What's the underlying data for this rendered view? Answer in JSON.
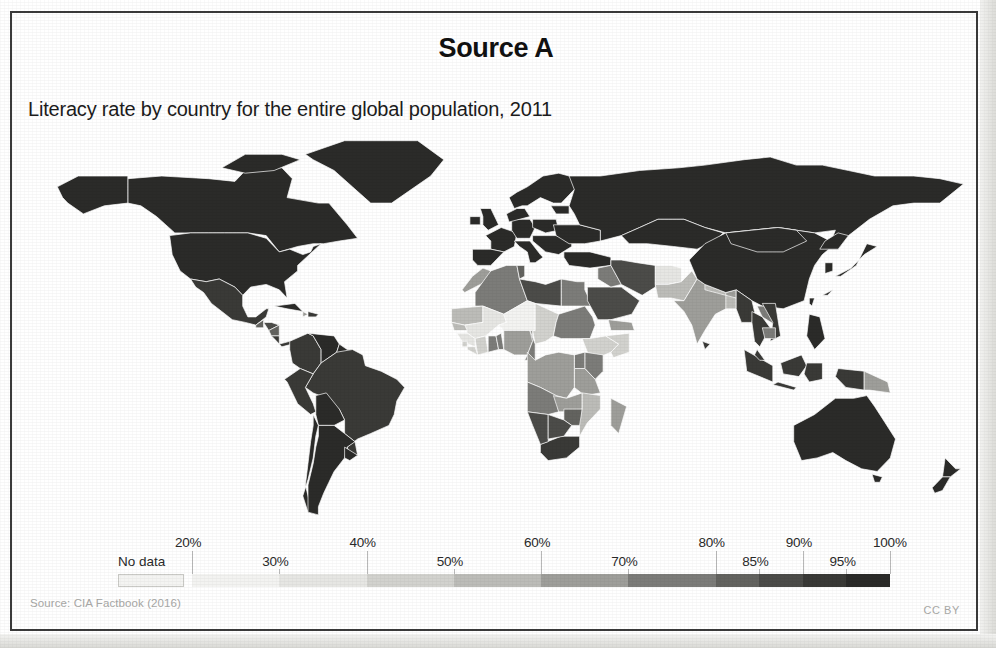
{
  "header": {
    "title": "Source A",
    "subtitle": "Literacy rate by country for the entire global population, 2011"
  },
  "footer": {
    "source": "Source: CIA Factbook (2016)",
    "license": "CC BY"
  },
  "legend": {
    "no_data_label": "No data",
    "no_data_color": "#f4f4f2",
    "ticks": [
      {
        "label": "20%",
        "pos": 0.0,
        "row": "top"
      },
      {
        "label": "30%",
        "pos": 0.125,
        "row": "bot"
      },
      {
        "label": "40%",
        "pos": 0.25,
        "row": "top"
      },
      {
        "label": "50%",
        "pos": 0.375,
        "row": "bot"
      },
      {
        "label": "60%",
        "pos": 0.5,
        "row": "top"
      },
      {
        "label": "70%",
        "pos": 0.625,
        "row": "bot"
      },
      {
        "label": "80%",
        "pos": 0.75,
        "row": "top"
      },
      {
        "label": "85%",
        "pos": 0.8125,
        "row": "bot"
      },
      {
        "label": "90%",
        "pos": 0.875,
        "row": "top"
      },
      {
        "label": "95%",
        "pos": 0.9375,
        "row": "bot"
      },
      {
        "label": "100%",
        "pos": 1.0,
        "row": "top"
      }
    ],
    "steps": [
      {
        "range": "20-30%",
        "color": "#f3f3f1",
        "width": 12.5
      },
      {
        "range": "30-40%",
        "color": "#e6e6e3",
        "width": 12.5
      },
      {
        "range": "40-50%",
        "color": "#d2d2ce",
        "width": 12.5
      },
      {
        "range": "50-60%",
        "color": "#bcbcb8",
        "width": 12.5
      },
      {
        "range": "60-70%",
        "color": "#9e9e9a",
        "width": 12.5
      },
      {
        "range": "70-80%",
        "color": "#7c7c79",
        "width": 12.5
      },
      {
        "range": "80-85%",
        "color": "#63635f",
        "width": 6.25
      },
      {
        "range": "85-90%",
        "color": "#4c4c49",
        "width": 6.25
      },
      {
        "range": "90-95%",
        "color": "#3a3a37",
        "width": 6.25
      },
      {
        "range": "95-100%",
        "color": "#2b2b29",
        "width": 6.25
      }
    ]
  },
  "chart_data": {
    "type": "heatmap",
    "title": "Literacy rate by country for the entire global population, 2011",
    "subtitle": "Source A",
    "xlabel": "",
    "ylabel": "",
    "value_unit": "percent literate",
    "value_range": [
      20,
      100
    ],
    "legend_position": "bottom",
    "grid": false,
    "map_projection": "equirectangular-world",
    "no_data_color": "#f4f4f2",
    "color_scale": [
      "#f3f3f1",
      "#e6e6e3",
      "#d2d2ce",
      "#bcbcb8",
      "#9e9e9a",
      "#7c7c79",
      "#63635f",
      "#4c4c49",
      "#3a3a37",
      "#2b2b29"
    ],
    "regions": [
      {
        "name": "Canada",
        "value": 99,
        "color": "#2b2b29"
      },
      {
        "name": "United States",
        "value": 99,
        "color": "#2b2b29"
      },
      {
        "name": "Greenland",
        "value": 100,
        "color": "#2b2b29"
      },
      {
        "name": "Mexico",
        "value": 94,
        "color": "#3a3a37"
      },
      {
        "name": "Guatemala",
        "value": 81,
        "color": "#63635f"
      },
      {
        "name": "Honduras",
        "value": 86,
        "color": "#4c4c49"
      },
      {
        "name": "Nicaragua",
        "value": 83,
        "color": "#63635f"
      },
      {
        "name": "Cuba",
        "value": 100,
        "color": "#2b2b29"
      },
      {
        "name": "Haiti",
        "value": 61,
        "color": "#9e9e9a"
      },
      {
        "name": "Dominican Republic",
        "value": 92,
        "color": "#3a3a37"
      },
      {
        "name": "Colombia",
        "value": 94,
        "color": "#3a3a37"
      },
      {
        "name": "Venezuela",
        "value": 96,
        "color": "#2b2b29"
      },
      {
        "name": "Brazil",
        "value": 92,
        "color": "#3a3a37"
      },
      {
        "name": "Peru",
        "value": 94,
        "color": "#3a3a37"
      },
      {
        "name": "Bolivia",
        "value": 95,
        "color": "#2b2b29"
      },
      {
        "name": "Chile",
        "value": 99,
        "color": "#2b2b29"
      },
      {
        "name": "Argentina",
        "value": 98,
        "color": "#2b2b29"
      },
      {
        "name": "Uruguay",
        "value": 98,
        "color": "#2b2b29"
      },
      {
        "name": "United Kingdom",
        "value": 99,
        "color": "#2b2b29"
      },
      {
        "name": "France",
        "value": 99,
        "color": "#2b2b29"
      },
      {
        "name": "Germany",
        "value": 99,
        "color": "#2b2b29"
      },
      {
        "name": "Spain",
        "value": 98,
        "color": "#2b2b29"
      },
      {
        "name": "Italy",
        "value": 99,
        "color": "#2b2b29"
      },
      {
        "name": "Poland",
        "value": 100,
        "color": "#2b2b29"
      },
      {
        "name": "Russia",
        "value": 100,
        "color": "#2b2b29"
      },
      {
        "name": "Ukraine",
        "value": 100,
        "color": "#2b2b29"
      },
      {
        "name": "Turkey",
        "value": 95,
        "color": "#2b2b29"
      },
      {
        "name": "Morocco",
        "value": 68,
        "color": "#9e9e9a"
      },
      {
        "name": "Algeria",
        "value": 80,
        "color": "#7c7c79"
      },
      {
        "name": "Tunisia",
        "value": 81,
        "color": "#63635f"
      },
      {
        "name": "Libya",
        "value": 90,
        "color": "#4c4c49"
      },
      {
        "name": "Egypt",
        "value": 74,
        "color": "#7c7c79"
      },
      {
        "name": "Mauritania",
        "value": 52,
        "color": "#bcbcb8"
      },
      {
        "name": "Mali",
        "value": 33,
        "color": "#e6e6e3"
      },
      {
        "name": "Niger",
        "value": 19,
        "color": "#f3f3f1"
      },
      {
        "name": "Chad",
        "value": 40,
        "color": "#d2d2ce"
      },
      {
        "name": "Sudan",
        "value": 72,
        "color": "#7c7c79"
      },
      {
        "name": "Senegal",
        "value": 50,
        "color": "#bcbcb8"
      },
      {
        "name": "Guinea",
        "value": 30,
        "color": "#e6e6e3"
      },
      {
        "name": "Sierra Leone",
        "value": 43,
        "color": "#d2d2ce"
      },
      {
        "name": "Liberia",
        "value": 43,
        "color": "#d2d2ce"
      },
      {
        "name": "Cote d'Ivoire",
        "value": 41,
        "color": "#d2d2ce"
      },
      {
        "name": "Ghana",
        "value": 71,
        "color": "#7c7c79"
      },
      {
        "name": "Nigeria",
        "value": 60,
        "color": "#9e9e9a"
      },
      {
        "name": "Cameroon",
        "value": 71,
        "color": "#7c7c79"
      },
      {
        "name": "Ethiopia",
        "value": 39,
        "color": "#d2d2ce"
      },
      {
        "name": "Somalia",
        "value": 38,
        "color": "#d2d2ce"
      },
      {
        "name": "Kenya",
        "value": 78,
        "color": "#7c7c79"
      },
      {
        "name": "Uganda",
        "value": 73,
        "color": "#7c7c79"
      },
      {
        "name": "Tanzania",
        "value": 68,
        "color": "#9e9e9a"
      },
      {
        "name": "DR Congo",
        "value": 63,
        "color": "#9e9e9a"
      },
      {
        "name": "Angola",
        "value": 70,
        "color": "#7c7c79"
      },
      {
        "name": "Zambia",
        "value": 61,
        "color": "#9e9e9a"
      },
      {
        "name": "Zimbabwe",
        "value": 84,
        "color": "#63635f"
      },
      {
        "name": "Mozambique",
        "value": 56,
        "color": "#bcbcb8"
      },
      {
        "name": "Madagascar",
        "value": 64,
        "color": "#9e9e9a"
      },
      {
        "name": "South Africa",
        "value": 93,
        "color": "#3a3a37"
      },
      {
        "name": "Namibia",
        "value": 88,
        "color": "#4c4c49"
      },
      {
        "name": "Botswana",
        "value": 85,
        "color": "#4c4c49"
      },
      {
        "name": "Saudi Arabia",
        "value": 87,
        "color": "#4c4c49"
      },
      {
        "name": "Iran",
        "value": 85,
        "color": "#4c4c49"
      },
      {
        "name": "Iraq",
        "value": 79,
        "color": "#7c7c79"
      },
      {
        "name": "Yemen",
        "value": 65,
        "color": "#9e9e9a"
      },
      {
        "name": "Afghanistan",
        "value": 28,
        "color": "#e6e6e3"
      },
      {
        "name": "Pakistan",
        "value": 55,
        "color": "#bcbcb8"
      },
      {
        "name": "India",
        "value": 63,
        "color": "#9e9e9a"
      },
      {
        "name": "Nepal",
        "value": 57,
        "color": "#bcbcb8"
      },
      {
        "name": "Bangladesh",
        "value": 58,
        "color": "#bcbcb8"
      },
      {
        "name": "China",
        "value": 95,
        "color": "#2b2b29"
      },
      {
        "name": "Mongolia",
        "value": 98,
        "color": "#2b2b29"
      },
      {
        "name": "Kazakhstan",
        "value": 100,
        "color": "#2b2b29"
      },
      {
        "name": "Japan",
        "value": 99,
        "color": "#2b2b29"
      },
      {
        "name": "South Korea",
        "value": 98,
        "color": "#2b2b29"
      },
      {
        "name": "Thailand",
        "value": 93,
        "color": "#3a3a37"
      },
      {
        "name": "Vietnam",
        "value": 93,
        "color": "#3a3a37"
      },
      {
        "name": "Laos",
        "value": 73,
        "color": "#7c7c79"
      },
      {
        "name": "Cambodia",
        "value": 74,
        "color": "#7c7c79"
      },
      {
        "name": "Myanmar",
        "value": 93,
        "color": "#3a3a37"
      },
      {
        "name": "Indonesia",
        "value": 93,
        "color": "#3a3a37"
      },
      {
        "name": "Philippines",
        "value": 96,
        "color": "#2b2b29"
      },
      {
        "name": "Papua New Guinea",
        "value": 62,
        "color": "#9e9e9a"
      },
      {
        "name": "Australia",
        "value": 99,
        "color": "#2b2b29"
      },
      {
        "name": "New Zealand",
        "value": 99,
        "color": "#2b2b29"
      }
    ]
  }
}
